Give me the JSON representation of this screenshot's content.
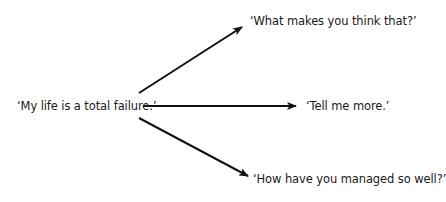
{
  "diagram": {
    "source": {
      "text": "‘My life is a total failure.’"
    },
    "responses": [
      {
        "text": "‘What makes you think that?’"
      },
      {
        "text": "‘Tell me more.’"
      },
      {
        "text": "‘How have you managed so well?’"
      }
    ],
    "colors": {
      "arrow": "#111111",
      "text": "#1a1a1a",
      "background": "#ffffff"
    }
  }
}
